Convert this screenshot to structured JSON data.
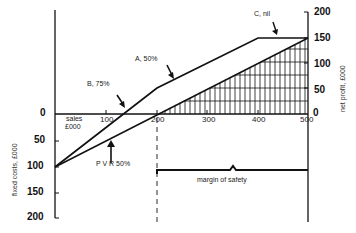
{
  "chart_data": {
    "type": "line",
    "title": "",
    "xlabel": "sales £000",
    "ylabel_left": "fixed costs, £000",
    "ylabel_right": "net profit, £000",
    "x_ticks": [
      "100",
      "200",
      "300",
      "400",
      "500"
    ],
    "y_ticks_right": [
      "200",
      "150",
      "100",
      "50",
      "0"
    ],
    "y_ticks_left": [
      "0",
      "50",
      "100",
      "150",
      "200"
    ],
    "xlim": [
      0,
      500
    ],
    "ylim": [
      -200,
      200
    ],
    "series": [
      {
        "name": "Company profit (products B, A, C)",
        "x": [
          0,
          200,
          400,
          500
        ],
        "y": [
          -100,
          50,
          150,
          150
        ]
      },
      {
        "name": "PVR 50%",
        "x": [
          0,
          500
        ],
        "y": [
          -100,
          150
        ]
      }
    ],
    "annotations": [
      {
        "text": "B, 75%",
        "x": 130,
        "y": 0
      },
      {
        "text": "A, 50%",
        "x": 300,
        "y": 100
      },
      {
        "text": "C, nil",
        "x": 450,
        "y": 150
      },
      {
        "text": "PVR 50%",
        "x": 150,
        "y": -25
      },
      {
        "text": "margin of safety",
        "x_from": 200,
        "x_to": 500
      }
    ],
    "shaded_region": {
      "description": "hatched area between PVR line and x-axis from 200 to 500",
      "x_from": 200,
      "x_to": 500
    },
    "breakeven_marker": {
      "x": 200,
      "style": "dashed vertical"
    },
    "grid": false,
    "legend": null
  },
  "labels": {
    "sales": "sales",
    "sales_unit": "£000",
    "fixed_costs": "fixed costs,  £000",
    "net_profit": "net  profit,  £000",
    "b": "B,  75%",
    "a": "A,  50%",
    "c": "C,  nil",
    "pvr": "P V R   50%",
    "mos": "margin  of  safety"
  }
}
